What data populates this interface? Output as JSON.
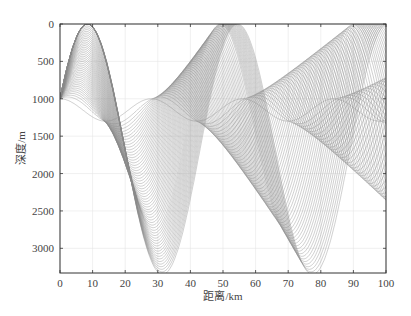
{
  "chart_data": {
    "type": "line",
    "title": "",
    "xlabel": "距离/km",
    "ylabel": "深度/m",
    "xlim": [
      0,
      100
    ],
    "ylim": [
      3330,
      0
    ],
    "y_inverted": true,
    "xticks": [
      0,
      10,
      20,
      30,
      40,
      50,
      60,
      70,
      80,
      90,
      100
    ],
    "yticks": [
      0,
      500,
      1000,
      1500,
      2000,
      2500,
      3000
    ],
    "grid": true,
    "legend": null,
    "source": {
      "range_km": 0,
      "depth_m": 1000
    },
    "ray_line_color": "#8a8a8a",
    "axis_color": "#333333",
    "grid_color": "#e6e6e6"
  },
  "axes": {
    "xlabel": "距离/km",
    "ylabel": "深度/m",
    "x_tick_labels": [
      "0",
      "10",
      "20",
      "30",
      "40",
      "50",
      "60",
      "70",
      "80",
      "90",
      "100"
    ],
    "y_tick_labels": [
      "0",
      "500",
      "1000",
      "1500",
      "2000",
      "2500",
      "3000"
    ]
  }
}
